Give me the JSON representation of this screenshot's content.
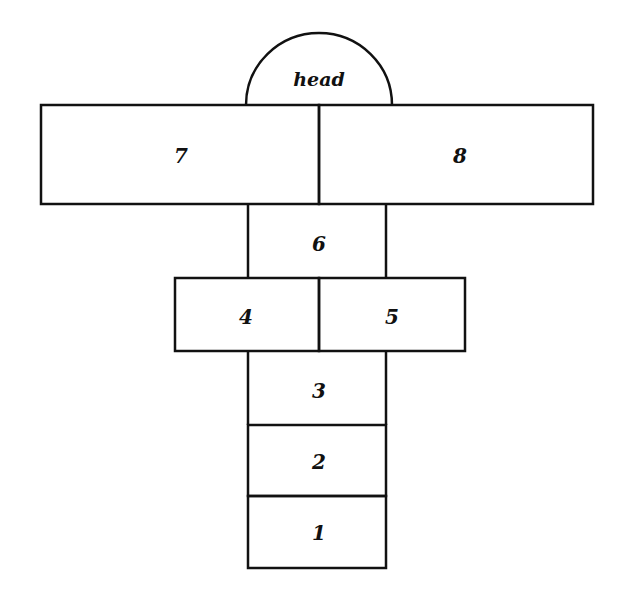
{
  "diagram": {
    "type": "hopscotch-court",
    "line_color": "#111111",
    "background": "#ffffff",
    "head": {
      "label": "head"
    },
    "squares": [
      {
        "id": "1",
        "label": "1"
      },
      {
        "id": "2",
        "label": "2"
      },
      {
        "id": "3",
        "label": "3"
      },
      {
        "id": "4",
        "label": "4"
      },
      {
        "id": "5",
        "label": "5"
      },
      {
        "id": "6",
        "label": "6"
      },
      {
        "id": "7",
        "label": "7"
      },
      {
        "id": "8",
        "label": "8"
      }
    ]
  }
}
